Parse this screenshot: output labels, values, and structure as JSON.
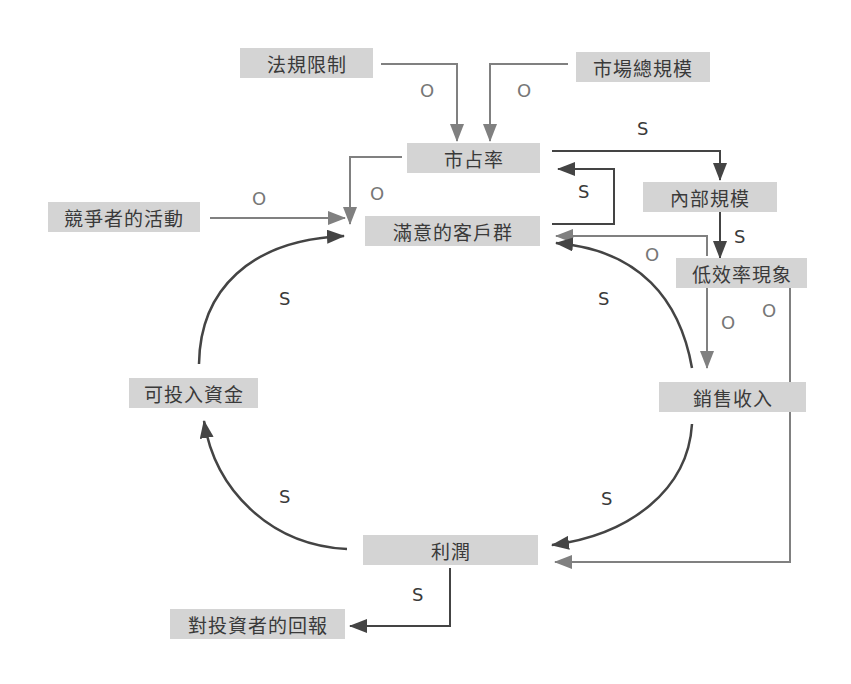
{
  "colors": {
    "node_fill": "#d4d4d4",
    "node_text": "#3a3a3a",
    "dark_link": "#444444",
    "light_link": "#808080"
  },
  "nodes": {
    "regulation": "法規限制",
    "market_size": "市場總規模",
    "market_share": "市占率",
    "internal_scale": "內部規模",
    "competitor_activity": "競爭者的活動",
    "satisfied_customers": "滿意的客戶群",
    "inefficiency": "低效率現象",
    "investable_funds": "可投入資金",
    "sales_revenue": "銷售收入",
    "profit": "利潤",
    "investor_return": "對投資者的回報"
  },
  "links": [
    {
      "from": "法規限制",
      "to": "市占率",
      "polarity": "O"
    },
    {
      "from": "市場總規模",
      "to": "市占率",
      "polarity": "O"
    },
    {
      "from": "市占率",
      "to": "內部規模",
      "polarity": "S"
    },
    {
      "from": "滿意的客戶群",
      "to": "市占率",
      "polarity": "S"
    },
    {
      "from": "市占率",
      "to": "滿意的客戶群",
      "polarity": "O"
    },
    {
      "from": "競爭者的活動",
      "to": "滿意的客戶群",
      "polarity": "O"
    },
    {
      "from": "內部規模",
      "to": "低效率現象",
      "polarity": "S"
    },
    {
      "from": "低效率現象",
      "to": "滿意的客戶群",
      "polarity": "O"
    },
    {
      "from": "低效率現象",
      "to": "銷售收入",
      "polarity": "O"
    },
    {
      "from": "低效率現象",
      "to": "利潤",
      "polarity": "O"
    },
    {
      "from": "銷售收入",
      "to": "滿意的客戶群",
      "polarity": "S"
    },
    {
      "from": "銷售收入",
      "to": "利潤",
      "polarity": "S"
    },
    {
      "from": "利潤",
      "to": "可投入資金",
      "polarity": "S"
    },
    {
      "from": "可投入資金",
      "to": "滿意的客戶群",
      "polarity": "S"
    },
    {
      "from": "利潤",
      "to": "對投資者的回報",
      "polarity": "S"
    }
  ],
  "labels": {
    "o": "O",
    "s": "S"
  }
}
